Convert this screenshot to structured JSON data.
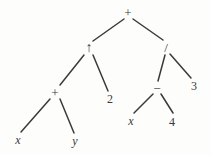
{
  "figure": {
    "caption": "",
    "stroke_color": "#3a3a3a",
    "background_color": "#fdfdfb"
  },
  "diagram": {
    "type": "expression-tree",
    "expression": "(x + y) ↑ 2 + (x − 4) / 3",
    "nodes": [
      {
        "id": "n0",
        "label": "+",
        "kind": "operator",
        "x": 128,
        "y": 12
      },
      {
        "id": "n1",
        "label": "↑",
        "kind": "operator",
        "x": 89,
        "y": 48
      },
      {
        "id": "n2",
        "label": "/",
        "kind": "operator",
        "x": 166,
        "y": 47
      },
      {
        "id": "n3",
        "label": "+",
        "kind": "operator",
        "x": 55,
        "y": 92
      },
      {
        "id": "n4",
        "label": "2",
        "kind": "number",
        "x": 110,
        "y": 99
      },
      {
        "id": "n5",
        "label": "−",
        "kind": "operator",
        "x": 157,
        "y": 88
      },
      {
        "id": "n6",
        "label": "3",
        "kind": "number",
        "x": 194,
        "y": 86
      },
      {
        "id": "n7",
        "label": "x",
        "kind": "variable",
        "x": 18,
        "y": 140
      },
      {
        "id": "n8",
        "label": "y",
        "kind": "variable",
        "x": 75,
        "y": 141
      },
      {
        "id": "n9",
        "label": "x",
        "kind": "variable",
        "x": 131,
        "y": 121
      },
      {
        "id": "n10",
        "label": "4",
        "kind": "number",
        "x": 172,
        "y": 122
      }
    ],
    "edges": [
      {
        "from": "n0",
        "to": "n1",
        "x1": 124,
        "y1": 19,
        "x2": 93,
        "y2": 41
      },
      {
        "from": "n0",
        "to": "n2",
        "x1": 133,
        "y1": 19,
        "x2": 163,
        "y2": 40
      },
      {
        "from": "n1",
        "to": "n3",
        "x1": 84,
        "y1": 55,
        "x2": 60,
        "y2": 85
      },
      {
        "from": "n1",
        "to": "n4",
        "x1": 93,
        "y1": 55,
        "x2": 108,
        "y2": 91
      },
      {
        "from": "n2",
        "to": "n5",
        "x1": 165,
        "y1": 55,
        "x2": 158,
        "y2": 81
      },
      {
        "from": "n2",
        "to": "n6",
        "x1": 170,
        "y1": 54,
        "x2": 191,
        "y2": 78
      },
      {
        "from": "n3",
        "to": "n7",
        "x1": 50,
        "y1": 99,
        "x2": 21,
        "y2": 132
      },
      {
        "from": "n3",
        "to": "n8",
        "x1": 60,
        "y1": 99,
        "x2": 74,
        "y2": 133
      },
      {
        "from": "n5",
        "to": "n9",
        "x1": 153,
        "y1": 94,
        "x2": 134,
        "y2": 113
      },
      {
        "from": "n5",
        "to": "n10",
        "x1": 161,
        "y1": 94,
        "x2": 173,
        "y2": 113
      }
    ]
  }
}
